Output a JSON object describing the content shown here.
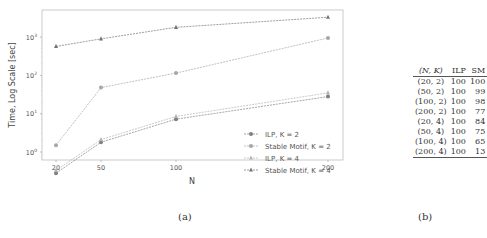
{
  "figure": {
    "caption_a": "(a)",
    "caption_b": "(b)"
  },
  "chart_data": [
    {
      "type": "line",
      "title": "",
      "xlabel": "N",
      "ylabel": "Time, Log Scale [sec]",
      "yscale": "log",
      "ylim": [
        0.2,
        6000
      ],
      "x": [
        20,
        50,
        100,
        200
      ],
      "xticks": [
        "20",
        "50",
        "100",
        "200"
      ],
      "yticks": [
        "10^0",
        "10^1",
        "10^2",
        "10^3"
      ],
      "grid": false,
      "legend_position": "lower right",
      "series": [
        {
          "name": "ILP, K = 2",
          "marker": "circle",
          "color": "#7f7f7f",
          "linestyle": "dashed",
          "values": [
            0.28,
            1.8,
            7.2,
            28
          ]
        },
        {
          "name": "Stable Motif, K = 2",
          "marker": "circle",
          "color": "#a6a6a6",
          "linestyle": "dashed",
          "values": [
            1.5,
            48,
            115,
            950
          ]
        },
        {
          "name": "ILP, K = 4",
          "marker": "triangle",
          "color": "#b3b3b3",
          "linestyle": "dashed",
          "values": [
            0.33,
            2.1,
            8.5,
            35
          ]
        },
        {
          "name": "Stable Motif, K = 4",
          "marker": "triangle",
          "color": "#737373",
          "linestyle": "dashed",
          "values": [
            570,
            900,
            1800,
            3300
          ]
        }
      ]
    },
    {
      "type": "table",
      "columns": [
        "(N, K)",
        "ILP",
        "SM"
      ],
      "rows": [
        [
          "(20, 2)",
          "100",
          "100"
        ],
        [
          "(50, 2)",
          "100",
          "99"
        ],
        [
          "(100, 2)",
          "100",
          "98"
        ],
        [
          "(200, 2)",
          "100",
          "77"
        ],
        [
          "(20, 4)",
          "100",
          "84"
        ],
        [
          "(50, 4)",
          "100",
          "75"
        ],
        [
          "(100, 4)",
          "100",
          "65"
        ],
        [
          "(200, 4)",
          "100",
          "13"
        ]
      ]
    }
  ]
}
